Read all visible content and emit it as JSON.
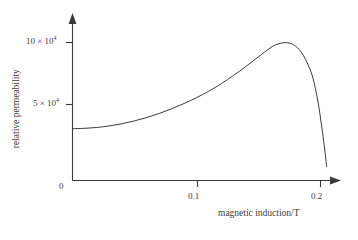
{
  "chart_data": {
    "type": "line",
    "title": "",
    "xlabel": "magnetic induction/T",
    "ylabel": "relative permeability",
    "xlim": [
      0,
      0.22
    ],
    "ylim": [
      0,
      11.5
    ],
    "y_scale_factor": "10^4",
    "grid": false,
    "legend": null,
    "x_ticks": [
      {
        "value": 0,
        "label": "0"
      },
      {
        "value": 0.1,
        "label": "0.1"
      },
      {
        "value": 0.2,
        "label": "0.2"
      }
    ],
    "y_ticks": [
      {
        "value": 5,
        "label_mantissa": "5 × 10",
        "label_exponent": "4"
      },
      {
        "value": 10,
        "label_mantissa": "10 × 10",
        "label_exponent": "4"
      }
    ],
    "series": [
      {
        "name": "relative permeability vs magnetic induction",
        "x": [
          0.0,
          0.01,
          0.02,
          0.03,
          0.04,
          0.05,
          0.06,
          0.07,
          0.08,
          0.09,
          0.1,
          0.11,
          0.12,
          0.13,
          0.14,
          0.15,
          0.16,
          0.165,
          0.17,
          0.175,
          0.18,
          0.185,
          0.19,
          0.194,
          0.198,
          0.201,
          0.203,
          0.205
        ],
        "y": [
          3.05,
          3.08,
          3.15,
          3.28,
          3.45,
          3.68,
          3.95,
          4.28,
          4.66,
          5.08,
          5.55,
          6.08,
          6.68,
          7.35,
          8.08,
          8.85,
          9.6,
          9.85,
          9.98,
          9.95,
          9.7,
          9.15,
          8.2,
          7.1,
          5.2,
          3.2,
          1.7,
          0.0
        ]
      }
    ],
    "annotations": {
      "peak_x": 0.17,
      "peak_y": 9.98,
      "start_y": 3.05,
      "zero_crossing_x": 0.205
    },
    "axis_style": {
      "x_axis_arrow": true,
      "y_axis_arrow": true,
      "line_color": "#3a3a3a",
      "background": "#ffffff"
    }
  },
  "axis_titles": {
    "x": "magnetic induction/T",
    "y": "relative permeability"
  },
  "tick_text": {
    "x0": "0",
    "x1": "0.1",
    "x2": "0.2",
    "y5_mantissa": "5 × 10",
    "y5_exponent": "4",
    "y10_mantissa": "10 × 10",
    "y10_exponent": "4"
  }
}
